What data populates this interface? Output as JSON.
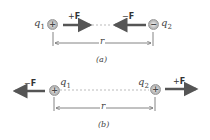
{
  "diagram": {
    "panel_a": {
      "caption": "(a)",
      "q1": {
        "label": "q",
        "sub": "1",
        "sign": "+"
      },
      "q2": {
        "label": "q",
        "sub": "2",
        "sign": "−"
      },
      "force_on_q1": {
        "sign": "+",
        "symbol": "F",
        "direction": "right"
      },
      "force_on_q2": {
        "sign": "−",
        "symbol": "F",
        "direction": "left"
      },
      "separation": "r"
    },
    "panel_b": {
      "caption": "(b)",
      "q1": {
        "label": "q",
        "sub": "1",
        "sign": "+"
      },
      "q2": {
        "label": "q",
        "sub": "2",
        "sign": "+"
      },
      "force_on_q1": {
        "sign": "−",
        "symbol": "F",
        "direction": "left"
      },
      "force_on_q2": {
        "sign": "+",
        "symbol": "F",
        "direction": "right"
      },
      "separation": "r"
    },
    "colors": {
      "arrow": "#555555",
      "charge": "#bdbdbd",
      "dashed_line": "#aaaaaa"
    }
  }
}
